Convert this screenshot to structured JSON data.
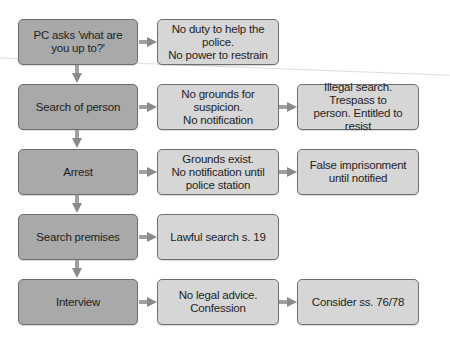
{
  "diagram": {
    "type": "flowchart",
    "colors": {
      "stage_fill": "#a9a9a9",
      "outcome_fill": "#d6d6d6",
      "border": "#6e6e6e",
      "arrow": "#8a8a8a"
    },
    "rows": [
      {
        "stage": "PC asks 'what are you up to?'",
        "outcomes": [
          "No duty to help the police.\nNo power to restrain"
        ]
      },
      {
        "stage": "Search of person",
        "outcomes": [
          "No grounds for suspicion.\nNo notification",
          "Illegal search. Trespass to\nperson. Entitled to resist"
        ]
      },
      {
        "stage": "Arrest",
        "outcomes": [
          "Grounds exist.\nNo notification until\npolice station",
          "False imprisonment\nuntil notified"
        ]
      },
      {
        "stage": "Search premises",
        "outcomes": [
          "Lawful search s. 19"
        ]
      },
      {
        "stage": "Interview",
        "outcomes": [
          "No legal advice.\nConfession",
          "Consider ss. 76/78"
        ]
      }
    ]
  }
}
